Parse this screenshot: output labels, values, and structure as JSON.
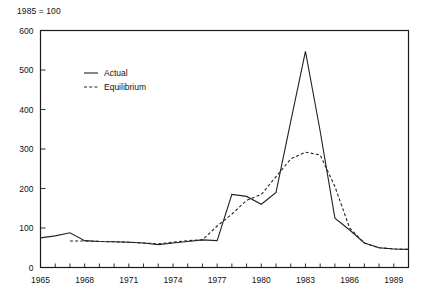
{
  "figure": {
    "unit_note": "1985 = 100",
    "background_color": "#ffffff",
    "line_color": "#222222"
  },
  "legend": {
    "position": "top-left-inside",
    "entries": [
      {
        "label": "Actual",
        "style": "solid"
      },
      {
        "label": "Equilibrium",
        "style": "dashed"
      }
    ]
  },
  "chart_data": {
    "type": "line",
    "title": "",
    "subtitle": "",
    "annotations": [
      "1985 = 100"
    ],
    "xlabel": "",
    "ylabel": "",
    "xlim": [
      1965,
      1990
    ],
    "ylim": [
      0,
      600
    ],
    "grid": false,
    "legend_position": "upper left",
    "y_ticks": [
      0,
      100,
      200,
      300,
      400,
      500,
      600
    ],
    "y_tick_labels": [
      "0",
      "100",
      "200",
      "300",
      "400",
      "500",
      "600"
    ],
    "x_ticks": [
      1965,
      1966,
      1967,
      1968,
      1969,
      1970,
      1971,
      1972,
      1973,
      1974,
      1975,
      1976,
      1977,
      1978,
      1979,
      1980,
      1981,
      1982,
      1983,
      1984,
      1985,
      1986,
      1987,
      1988,
      1989,
      1990
    ],
    "x_tick_labels_shown": [
      "1965",
      "1968",
      "1971",
      "1974",
      "1977",
      "1980",
      "1983",
      "1986",
      "1989"
    ],
    "x_tick_label_years": [
      1965,
      1968,
      1971,
      1974,
      1977,
      1980,
      1983,
      1986,
      1989
    ],
    "x": [
      1965,
      1966,
      1967,
      1968,
      1969,
      1970,
      1971,
      1972,
      1973,
      1974,
      1975,
      1976,
      1977,
      1978,
      1979,
      1980,
      1981,
      1982,
      1983,
      1984,
      1985,
      1986,
      1987,
      1988,
      1989,
      1990
    ],
    "series": [
      {
        "name": "Actual",
        "style": "solid",
        "values": [
          75,
          80,
          88,
          68,
          66,
          65,
          64,
          62,
          58,
          62,
          66,
          70,
          68,
          185,
          180,
          160,
          190,
          370,
          547,
          345,
          125,
          95,
          62,
          50,
          47,
          46
        ]
      },
      {
        "name": "Equilibrium",
        "style": "dashed",
        "values": [
          null,
          null,
          67,
          67,
          66,
          65,
          64,
          62,
          60,
          64,
          68,
          70,
          105,
          135,
          170,
          185,
          230,
          275,
          292,
          285,
          205,
          100,
          62,
          50,
          47,
          46
        ]
      }
    ]
  }
}
